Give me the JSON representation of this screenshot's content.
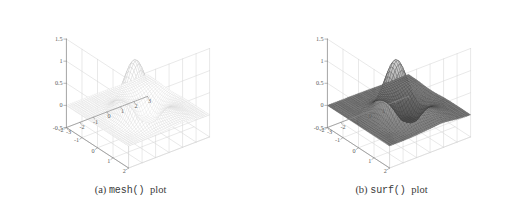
{
  "figure": {
    "panels": [
      {
        "id": "a",
        "caption_tag": "(a)",
        "caption_code": "mesh()",
        "caption_tail": "plot",
        "render_style": "wireframe"
      },
      {
        "id": "b",
        "caption_tag": "(b)",
        "caption_code": "surf()",
        "caption_tail": "plot",
        "render_style": "shaded"
      }
    ]
  },
  "colors": {
    "background": "#ffffff",
    "grid": "#d2d2d2",
    "axis": "#8a8a8a",
    "tick_text": "#5d5d5d",
    "caption_text": "#3a3a3a",
    "mesh_line": "#b4b4b4",
    "mesh_line_peak": "#8f8f8f",
    "surf_line": "#3c3c3c",
    "surf_face_light": "#d8d8d8",
    "surf_face_dark": "#4a4a4a"
  },
  "chart_data": [
    {
      "type": "surface",
      "title": "mesh() plot",
      "panel": "a",
      "render": "wireframe",
      "xlabel": "",
      "ylabel": "",
      "zlabel": "",
      "xlim": [
        -3,
        3
      ],
      "ylim": [
        -2,
        2
      ],
      "zlim": [
        -0.5,
        1.5
      ],
      "x_ticks": [
        -3,
        -2,
        -1,
        0,
        1,
        2,
        3
      ],
      "x_tick_labels": [
        "-3",
        "-2",
        "-1",
        "0",
        "1",
        "2",
        "3"
      ],
      "y_ticks": [
        -2,
        -1,
        0,
        1,
        2
      ],
      "y_tick_labels": [
        "-2",
        "-1",
        "0",
        "1",
        "2"
      ],
      "z_ticks": [
        -0.5,
        0,
        0.5,
        1,
        1.5
      ],
      "z_tick_labels": [
        "-0.5",
        "0",
        "0.5",
        "1",
        "1.5"
      ],
      "grid": true,
      "legend": "none",
      "view_azimuth": -37.5,
      "view_elevation": 30,
      "grid_n_x": 41,
      "grid_n_y": 41,
      "surface_peaks": [
        {
          "amplitude": 1.28,
          "cx": -0.6,
          "cy": 0.35,
          "sx": 0.85,
          "sy": 0.78
        },
        {
          "amplitude": -0.62,
          "cx": 1.35,
          "cy": -0.55,
          "sx": 0.95,
          "sy": 0.72
        },
        {
          "amplitude": 0.16,
          "cx": 0.9,
          "cy": 1.1,
          "sx": 1.1,
          "sy": 0.9
        }
      ],
      "z_max_observed": 1.28,
      "z_min_observed": -0.62
    },
    {
      "type": "surface",
      "title": "surf() plot",
      "panel": "b",
      "render": "shaded",
      "xlabel": "",
      "ylabel": "",
      "zlabel": "",
      "xlim": [
        -3,
        3
      ],
      "ylim": [
        -2,
        2
      ],
      "zlim": [
        -0.5,
        1.5
      ],
      "x_ticks": [
        -3,
        -2,
        -1,
        0,
        1,
        2,
        3
      ],
      "x_tick_labels": [
        "-3",
        "-2",
        "-1",
        "0",
        "1",
        "2",
        "3"
      ],
      "y_ticks": [
        -2,
        -1,
        0,
        1,
        2
      ],
      "y_tick_labels": [
        "-2",
        "-1",
        "0",
        "1",
        "2"
      ],
      "z_ticks": [
        -0.5,
        0,
        0.5,
        1,
        1.5
      ],
      "z_tick_labels": [
        "-0.5",
        "0",
        "0.5",
        "1",
        "1.5"
      ],
      "grid": true,
      "legend": "none",
      "view_azimuth": -37.5,
      "view_elevation": 30,
      "grid_n_x": 41,
      "grid_n_y": 41,
      "surface_peaks": [
        {
          "amplitude": 1.28,
          "cx": -0.6,
          "cy": 0.35,
          "sx": 0.85,
          "sy": 0.78
        },
        {
          "amplitude": -0.62,
          "cx": 1.35,
          "cy": -0.55,
          "sx": 0.95,
          "sy": 0.72
        },
        {
          "amplitude": 0.16,
          "cx": 0.9,
          "cy": 1.1,
          "sx": 1.1,
          "sy": 0.9
        }
      ],
      "z_max_observed": 1.28,
      "z_min_observed": -0.62
    }
  ]
}
